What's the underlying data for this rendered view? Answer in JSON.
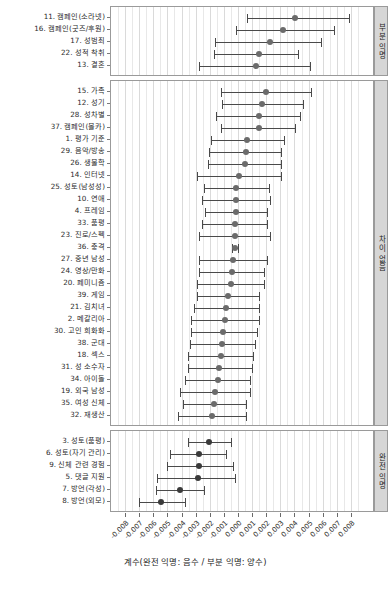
{
  "chart_data": {
    "type": "scatter",
    "subtype": "forest-plot-coefficients-with-confidence-intervals",
    "title": "",
    "xlabel": "계수(완전 익명: 음수 / 부분 익명: 양수)",
    "ylabel": "",
    "xlim": [
      -0.0085,
      0.0085
    ],
    "xticks": [
      -0.008,
      -0.007,
      -0.006,
      -0.005,
      -0.004,
      -0.003,
      -0.002,
      -0.001,
      0.0,
      0.001,
      0.002,
      0.003,
      0.004,
      0.005,
      0.006,
      0.007,
      0.008
    ],
    "xticklabels": [
      "-0.008",
      "-0.007",
      "-0.006",
      "-0.005",
      "-0.004",
      "-0.003",
      "-0.002",
      "-0.001",
      "0.000",
      "0.001",
      "0.002",
      "0.003",
      "0.004",
      "0.005",
      "0.006",
      "0.007",
      "0.008"
    ],
    "grid": true,
    "legend": null,
    "facets": [
      {
        "strip_label": "부분 익명",
        "points": [
          {
            "label": "11. 캠페인(소라넷)",
            "estimate": 0.004,
            "low": 0.0006,
            "high": 0.0078
          },
          {
            "label": "16. 캠페인(굿즈/후원)",
            "estimate": 0.0031,
            "low": -0.0002,
            "high": 0.0067
          },
          {
            "label": "17. 성범죄",
            "estimate": 0.0022,
            "low": -0.0017,
            "high": 0.0058
          },
          {
            "label": "22. 성적 착취",
            "estimate": 0.0014,
            "low": -0.0018,
            "high": 0.0042
          },
          {
            "label": "13. 결혼",
            "estimate": 0.0012,
            "low": -0.0028,
            "high": 0.005
          }
        ]
      },
      {
        "strip_label": "차이 없음",
        "points": [
          {
            "label": "15. 가족",
            "estimate": 0.0019,
            "low": -0.0013,
            "high": 0.0051
          },
          {
            "label": "12. 성기",
            "estimate": 0.0016,
            "low": -0.0012,
            "high": 0.0045
          },
          {
            "label": "28. 성차별",
            "estimate": 0.0014,
            "low": -0.0016,
            "high": 0.0043
          },
          {
            "label": "37. 캠페인(몰카)",
            "estimate": 0.0014,
            "low": -0.0013,
            "high": 0.004
          },
          {
            "label": "1. 평가 기준",
            "estimate": 0.0006,
            "low": -0.002,
            "high": 0.0032
          },
          {
            "label": "29. 음악/방송",
            "estimate": 0.0005,
            "low": -0.0021,
            "high": 0.003
          },
          {
            "label": "26. 생물학",
            "estimate": 0.0004,
            "low": -0.0022,
            "high": 0.003
          },
          {
            "label": "14. 인터넷",
            "estimate": 0.0,
            "low": -0.003,
            "high": 0.003
          },
          {
            "label": "25. 성토(남성성)",
            "estimate": -0.0002,
            "low": -0.0025,
            "high": 0.0021
          },
          {
            "label": "10. 연애",
            "estimate": -0.0002,
            "low": -0.0026,
            "high": 0.0022
          },
          {
            "label": "4. 프레임",
            "estimate": -0.0002,
            "low": -0.0024,
            "high": 0.002
          },
          {
            "label": "33. 품평",
            "estimate": -0.0003,
            "low": -0.0026,
            "high": 0.002
          },
          {
            "label": "23. 진로/스펙",
            "estimate": -0.0003,
            "low": -0.0028,
            "high": 0.0022
          },
          {
            "label": "36. 충격",
            "estimate": -0.0003,
            "low": -0.0005,
            "high": -0.0001
          },
          {
            "label": "27. 중년 남성",
            "estimate": -0.0004,
            "low": -0.0028,
            "high": 0.002
          },
          {
            "label": "24. 영상/만화",
            "estimate": -0.0005,
            "low": -0.0028,
            "high": 0.0018
          },
          {
            "label": "20. 페미니즘",
            "estimate": -0.0006,
            "low": -0.003,
            "high": 0.0018
          },
          {
            "label": "39. 게임",
            "estimate": -0.0008,
            "low": -0.003,
            "high": 0.0014
          },
          {
            "label": "21. 김치녀",
            "estimate": -0.0009,
            "low": -0.0032,
            "high": 0.0014
          },
          {
            "label": "2. 메갈리아",
            "estimate": -0.001,
            "low": -0.0034,
            "high": 0.0014
          },
          {
            "label": "30. 고인 희화화",
            "estimate": -0.0011,
            "low": -0.0034,
            "high": 0.0013
          },
          {
            "label": "38. 군대",
            "estimate": -0.0012,
            "low": -0.0035,
            "high": 0.0011
          },
          {
            "label": "18. 섹스",
            "estimate": -0.0013,
            "low": -0.0036,
            "high": 0.001
          },
          {
            "label": "31. 성 소수자",
            "estimate": -0.0014,
            "low": -0.0036,
            "high": 0.0009
          },
          {
            "label": "34. 아이돌",
            "estimate": -0.0015,
            "low": -0.0038,
            "high": 0.0008
          },
          {
            "label": "19. 외국 남성",
            "estimate": -0.0017,
            "low": -0.0042,
            "high": 0.0008
          },
          {
            "label": "35. 여성 신체",
            "estimate": -0.0018,
            "low": -0.004,
            "high": 0.0005
          },
          {
            "label": "32. 재생산",
            "estimate": -0.0019,
            "low": -0.0043,
            "high": 0.0005
          }
        ]
      },
      {
        "strip_label": "완전 익명",
        "points": [
          {
            "label": "3. 성토(품평)",
            "estimate": -0.0021,
            "low": -0.0036,
            "high": -0.0006
          },
          {
            "label": "6. 성토(자기 관리)",
            "estimate": -0.0028,
            "low": -0.0049,
            "high": -0.0009
          },
          {
            "label": "9. 신체 관련 경험",
            "estimate": -0.0028,
            "low": -0.0051,
            "high": -0.0004
          },
          {
            "label": "5. 댓글 지원",
            "estimate": -0.0029,
            "low": -0.0058,
            "high": -0.0003
          },
          {
            "label": "7. 방언(각성)",
            "estimate": -0.0042,
            "low": -0.0059,
            "high": -0.0025
          },
          {
            "label": "8. 방언(외모)",
            "estimate": -0.0055,
            "low": -0.0071,
            "high": -0.0038
          }
        ]
      }
    ]
  },
  "style": {
    "point_color": "#6b6b6b",
    "line_color": "#4a4a4a",
    "strip_fill": "#d6d6d6",
    "panel_border": "#9a9a9a",
    "grid_color": "#e8e8e8"
  }
}
